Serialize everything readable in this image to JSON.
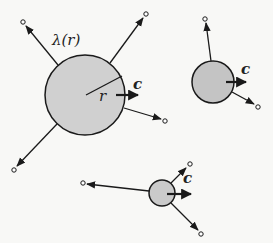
{
  "diagram": {
    "colors": {
      "background": "#f8f8f6",
      "stroke": "#1a1a1a",
      "large_fill": "#d0d0d0",
      "medium_fill": "#c4c4c4",
      "small_fill": "#cacaca"
    },
    "labels": {
      "rate": "λ(r)",
      "radius": "r",
      "velocity": "c"
    },
    "particles": [
      {
        "name": "large",
        "cx": 85,
        "cy": 95,
        "r": 40,
        "rays": [
          {
            "from": [
              58,
              65
            ],
            "to": [
              26,
              26
            ],
            "end": [
              23,
              22
            ]
          },
          {
            "from": [
              110,
              63
            ],
            "to": [
              143,
              18
            ],
            "end": [
              146,
              14
            ]
          },
          {
            "from": [
              124,
              108
            ],
            "to": [
              161,
              119
            ],
            "end": [
              165,
              121
            ]
          },
          {
            "from": [
              57,
              124
            ],
            "to": [
              17,
              166
            ],
            "end": [
              14,
              170
            ]
          }
        ],
        "velocity_arrow": {
          "from": [
            116,
            95
          ],
          "to": [
            138,
            95
          ]
        },
        "radius_line": {
          "from": [
            86,
            95
          ],
          "to": [
            122,
            76
          ]
        }
      },
      {
        "name": "medium",
        "cx": 213,
        "cy": 82,
        "r": 21,
        "rays": [
          {
            "from": [
              211,
              61
            ],
            "to": [
              206,
              23
            ],
            "end": [
              205,
              19
            ]
          },
          {
            "from": [
              232,
              92
            ],
            "to": [
              254,
              104
            ],
            "end": [
              258,
              107
            ]
          }
        ],
        "velocity_arrow": {
          "from": [
            226,
            82
          ],
          "to": [
            246,
            82
          ]
        }
      },
      {
        "name": "small",
        "cx": 162,
        "cy": 193,
        "r": 13,
        "rays": [
          {
            "from": [
              149,
              191
            ],
            "to": [
              87,
              184
            ],
            "end": [
              83,
              183
            ]
          },
          {
            "from": [
              171,
              183
            ],
            "to": [
              186,
              168
            ],
            "end": [
              190,
              164
            ]
          },
          {
            "from": [
              171,
              203
            ],
            "to": [
              198,
              230
            ],
            "end": [
              201,
              234
            ]
          }
        ],
        "velocity_arrow": {
          "from": [
            167,
            194
          ],
          "to": [
            191,
            194
          ]
        }
      }
    ]
  }
}
